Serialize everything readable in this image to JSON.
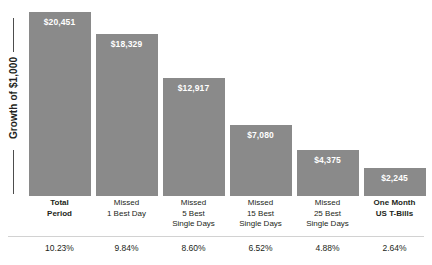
{
  "chart_data": {
    "type": "bar",
    "title": "",
    "xlabel": "",
    "ylabel": "Growth of $1,000",
    "grid": false,
    "legend": "none",
    "ylim": [
      0,
      21500
    ],
    "bar_color": "#8a8a8a",
    "categories": [
      "Total Period",
      "Missed 1 Best Day",
      "Missed 5 Best Single Days",
      "Missed 15 Best Single Days",
      "Missed 25 Best Single Days",
      "One Month US T-Bills"
    ],
    "values": [
      20451,
      18329,
      12917,
      7080,
      4375,
      2245
    ],
    "value_labels": [
      "$20,451",
      "$18,329",
      "$12,917",
      "$7,080",
      "$4,375",
      "$2,245"
    ],
    "annual_returns": [
      "10.23%",
      "9.84%",
      "8.60%",
      "6.52%",
      "4.88%",
      "2.64%"
    ]
  },
  "axis": {
    "y_label": "Growth of $1,000"
  },
  "bars": [
    {
      "value_label": "$20,451",
      "height_pct": 93.9,
      "cat_lines": [
        "Total",
        "Period"
      ],
      "bold": true,
      "pct": "10.23%"
    },
    {
      "value_label": "$18,329",
      "height_pct": 82.7,
      "cat_lines": [
        "Missed",
        "1 Best Day"
      ],
      "bold": false,
      "pct": "9.84%"
    },
    {
      "value_label": "$12,917",
      "height_pct": 60.2,
      "cat_lines": [
        "Missed",
        "5 Best",
        "Single Days"
      ],
      "bold": false,
      "pct": "8.60%"
    },
    {
      "value_label": "$7,080",
      "height_pct": 36.2,
      "cat_lines": [
        "Missed",
        "15 Best",
        "Single Days"
      ],
      "bold": false,
      "pct": "6.52%"
    },
    {
      "value_label": "$4,375",
      "height_pct": 23.5,
      "cat_lines": [
        "Missed",
        "25 Best",
        "Single Days"
      ],
      "bold": false,
      "pct": "4.88%"
    },
    {
      "value_label": "$2,245",
      "height_pct": 14.3,
      "cat_lines": [
        "One Month",
        "US T-Bills"
      ],
      "bold": true,
      "pct": "2.64%"
    }
  ]
}
